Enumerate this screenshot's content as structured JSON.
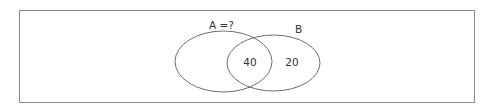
{
  "diagram": {
    "type": "venn",
    "sets": [
      {
        "id": "A",
        "label": "A =?",
        "only_value": ""
      },
      {
        "id": "B",
        "label": "B",
        "only_value": "20"
      }
    ],
    "intersection": {
      "sets": [
        "A",
        "B"
      ],
      "value": "40"
    },
    "colors": {
      "stroke": "#6e6e6e",
      "frame": "#8a8a8a",
      "text": "#333333",
      "background": "#ffffff"
    }
  }
}
